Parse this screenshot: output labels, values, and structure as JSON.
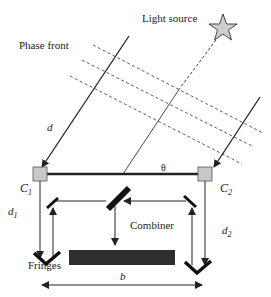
{
  "diagram": {
    "type": "optical-interferometer",
    "labels": {
      "light_source": "Light source",
      "phase_front": "Phase front",
      "path_delay": "d",
      "angle": "θ",
      "collector_1": "C",
      "collector_1_sub": "1",
      "collector_2": "C",
      "collector_2_sub": "2",
      "delay_1": "d",
      "delay_1_sub": "1",
      "delay_2": "d",
      "delay_2_sub": "2",
      "combiner": "Combiner",
      "fringes": "Fringes",
      "baseline": "b"
    },
    "colors": {
      "line": "#222222",
      "collector_fill": "#c8c8c8",
      "star_fill": "#cfcfcf",
      "background": "#ffffff"
    }
  }
}
